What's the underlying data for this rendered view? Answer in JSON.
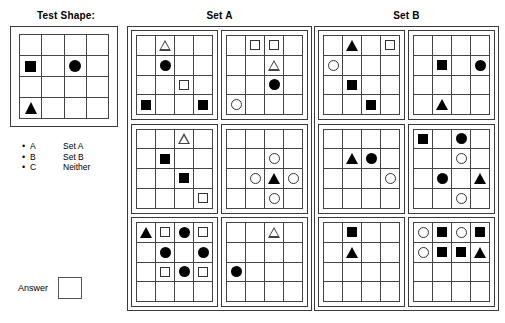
{
  "left": {
    "test_shape_title": "Test Shape:",
    "test_shape_grid": [
      [
        "",
        "",
        "",
        ""
      ],
      [
        "square-filled",
        "",
        "circle-filled",
        ""
      ],
      [
        "",
        "",
        "",
        ""
      ],
      [
        "triangle-filled",
        "",
        "",
        ""
      ]
    ],
    "legend": [
      {
        "bullet": "•",
        "key": "A",
        "value": "Set A"
      },
      {
        "bullet": "•",
        "key": "B",
        "value": "Set B"
      },
      {
        "bullet": "•",
        "key": "C",
        "value": "Neither"
      }
    ],
    "answer_label": "Answer",
    "answer_value": ""
  },
  "set_a": {
    "title": "Set A",
    "panels": [
      {
        "name": "set-a-panel-1",
        "grid": [
          [
            "",
            "triangle-open",
            "",
            ""
          ],
          [
            "",
            "circle-filled",
            "",
            ""
          ],
          [
            "",
            "",
            "square-open",
            ""
          ],
          [
            "square-filled",
            "",
            "",
            "square-filled"
          ]
        ]
      },
      {
        "name": "set-a-panel-2",
        "grid": [
          [
            "",
            "square-open",
            "square-open",
            ""
          ],
          [
            "",
            "",
            "triangle-open",
            ""
          ],
          [
            "",
            "",
            "circle-filled",
            ""
          ],
          [
            "circle-open",
            "",
            "",
            ""
          ]
        ]
      },
      {
        "name": "set-a-panel-3",
        "grid": [
          [
            "",
            "",
            "triangle-open",
            ""
          ],
          [
            "",
            "square-filled",
            "",
            ""
          ],
          [
            "",
            "",
            "square-filled",
            ""
          ],
          [
            "",
            "",
            "",
            "square-open"
          ]
        ]
      },
      {
        "name": "set-a-panel-4",
        "grid": [
          [
            "",
            "",
            "",
            ""
          ],
          [
            "",
            "",
            "circle-open",
            ""
          ],
          [
            "",
            "circle-open",
            "triangle-filled",
            "circle-open"
          ],
          [
            "",
            "",
            "circle-open",
            ""
          ]
        ]
      },
      {
        "name": "set-a-panel-5",
        "grid": [
          [
            "triangle-filled",
            "square-open",
            "circle-filled",
            "square-open"
          ],
          [
            "",
            "circle-filled",
            "",
            "circle-filled"
          ],
          [
            "",
            "square-open",
            "circle-filled",
            "square-open"
          ],
          [
            "",
            "",
            "",
            ""
          ]
        ]
      },
      {
        "name": "set-a-panel-6",
        "grid": [
          [
            "",
            "",
            "triangle-open",
            ""
          ],
          [
            "",
            "",
            "",
            ""
          ],
          [
            "circle-filled",
            "",
            "",
            ""
          ],
          [
            "",
            "",
            "",
            ""
          ]
        ]
      }
    ]
  },
  "set_b": {
    "title": "Set B",
    "panels": [
      {
        "name": "set-b-panel-1",
        "grid": [
          [
            "",
            "triangle-filled",
            "",
            "square-open"
          ],
          [
            "circle-open",
            "",
            "",
            ""
          ],
          [
            "",
            "square-filled",
            "",
            ""
          ],
          [
            "",
            "",
            "square-filled",
            ""
          ]
        ]
      },
      {
        "name": "set-b-panel-2",
        "grid": [
          [
            "",
            "",
            "",
            ""
          ],
          [
            "",
            "square-filled",
            "",
            "circle-filled"
          ],
          [
            "",
            "",
            "",
            ""
          ],
          [
            "",
            "triangle-filled",
            "",
            ""
          ]
        ]
      },
      {
        "name": "set-b-panel-3",
        "grid": [
          [
            "",
            "",
            "",
            ""
          ],
          [
            "",
            "triangle-filled",
            "circle-filled",
            ""
          ],
          [
            "",
            "",
            "",
            "circle-open"
          ],
          [
            "",
            "",
            "",
            ""
          ]
        ]
      },
      {
        "name": "set-b-panel-4",
        "grid": [
          [
            "square-filled",
            "",
            "circle-filled",
            ""
          ],
          [
            "",
            "",
            "circle-open",
            ""
          ],
          [
            "",
            "circle-filled",
            "",
            "triangle-filled"
          ],
          [
            "",
            "",
            "circle-open",
            ""
          ]
        ]
      },
      {
        "name": "set-b-panel-5",
        "grid": [
          [
            "",
            "square-filled",
            "",
            ""
          ],
          [
            "",
            "triangle-filled",
            "",
            ""
          ],
          [
            "",
            "",
            "",
            ""
          ],
          [
            "",
            "",
            "",
            ""
          ]
        ]
      },
      {
        "name": "set-b-panel-6",
        "grid": [
          [
            "circle-open",
            "square-filled",
            "circle-open",
            "square-filled"
          ],
          [
            "circle-open",
            "square-filled",
            "square-filled",
            "triangle-filled"
          ],
          [
            "",
            "",
            "",
            ""
          ],
          [
            "",
            "",
            "",
            ""
          ]
        ]
      }
    ]
  }
}
